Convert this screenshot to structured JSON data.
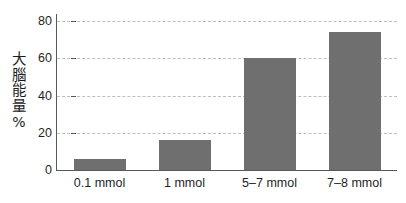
{
  "chart_data": {
    "type": "bar",
    "title": "",
    "subtitle": "",
    "xlabel": "",
    "ylabel": "大腦能量%",
    "ylabel_chars": [
      "大",
      "腦",
      "能",
      "量",
      "%"
    ],
    "categories": [
      "0.1 mmol",
      "1 mmol",
      "5–7 mmol",
      "7–8 mmol"
    ],
    "values": [
      6,
      16,
      60,
      74
    ],
    "ylim": [
      0,
      80
    ],
    "ytick_labels": [
      "0",
      "20",
      "40",
      "60",
      "80"
    ],
    "ytick_values": [
      0,
      20,
      40,
      60,
      80
    ],
    "grid": true,
    "gridlines_at": [
      20,
      40,
      60,
      80
    ],
    "legend": null,
    "legend_position": "none",
    "series": [
      {
        "name": "大腦能量%",
        "values": [
          6,
          16,
          60,
          74
        ]
      }
    ]
  },
  "style": {
    "bar_color": "#6f6f6f",
    "axis_color": "#55595d",
    "grid_color": "#b9bfc6",
    "text_color": "#1f1f1f",
    "background": "#ffffff"
  }
}
